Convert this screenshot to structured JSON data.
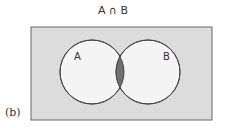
{
  "title": "A ∩ B",
  "panel_label": "(b)",
  "sets": [
    {
      "name": "A",
      "label": "A"
    },
    {
      "name": "B",
      "label": "B"
    }
  ],
  "shaded_region": "intersection",
  "colors": {
    "universe_fill": "#dcdcdc",
    "circle_fill": "#f4f4f4",
    "intersection_fill": "#707070",
    "stroke": "#444444"
  }
}
